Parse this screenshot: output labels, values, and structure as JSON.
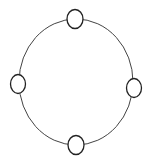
{
  "diagram": {
    "nodes": [
      {
        "id": "top",
        "label": ""
      },
      {
        "id": "right",
        "label": ""
      },
      {
        "id": "bottom",
        "label": ""
      },
      {
        "id": "left",
        "label": ""
      }
    ],
    "colors": {
      "stroke": "#2a2a2a",
      "fill": "#ffffff"
    }
  }
}
